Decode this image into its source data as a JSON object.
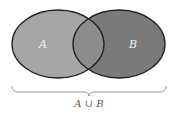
{
  "diagram": {
    "type": "venn",
    "sets": [
      {
        "id": "A",
        "label": "A",
        "fill": "#a6a6a6"
      },
      {
        "id": "B",
        "label": "B",
        "fill": "#7a7a7a"
      }
    ],
    "intersection_fill": "#8c8c8c",
    "stroke": "#222222",
    "brace": {
      "label": "A ∪ B",
      "color": "#888888"
    }
  }
}
